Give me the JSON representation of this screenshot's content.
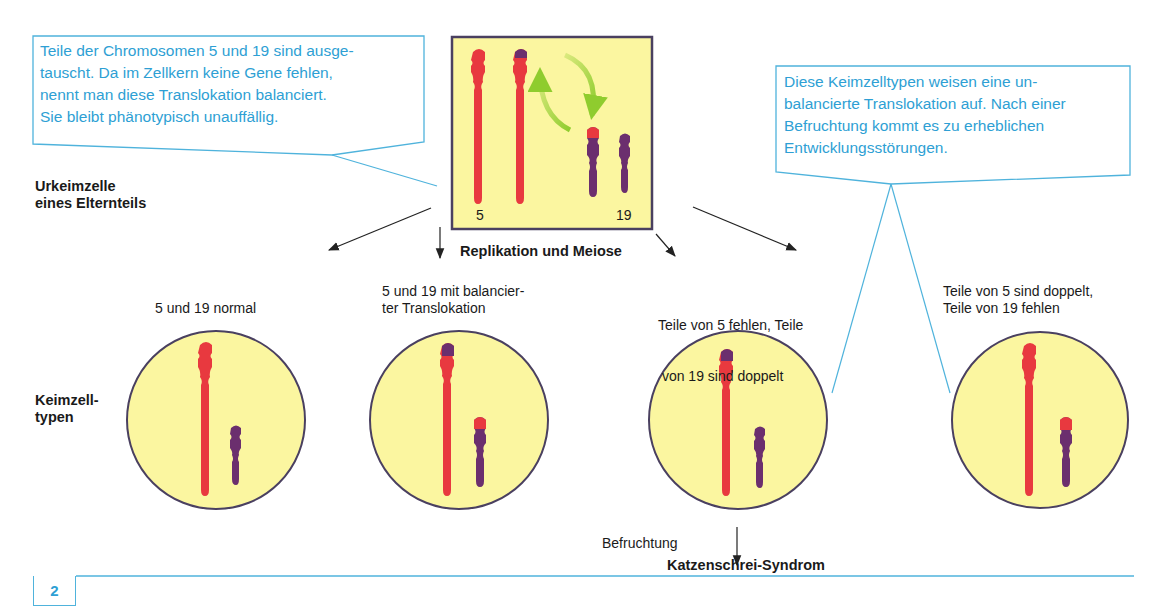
{
  "colors": {
    "callout_blue": "#4fb3dc",
    "callout_text": "#2e9fd4",
    "cell_fill": "#fbf6a0",
    "cell_stroke": "#4a4060",
    "chromosome5": "#e8393f",
    "chromosome19": "#6b2f6e",
    "exchange_arrow": "#8fcc2e",
    "black_arrow": "#222222"
  },
  "callouts": {
    "left": {
      "lines": [
        "Teile der Chromosomen 5 und 19 sind ausge-",
        "tauscht. Da im Zellkern keine Gene fehlen,",
        "nennt man diese Translokation balanciert.",
        "Sie bleibt phänotypisch unauffällig."
      ]
    },
    "right": {
      "lines": [
        "Diese Keimzelltypen weisen eine un-",
        "balancierte Translokation auf. Nach einer",
        "Befruchtung kommt es zu erheblichen",
        "Entwicklungsstörungen."
      ]
    }
  },
  "labels": {
    "parent_cell": [
      "Urkeimzelle",
      "eines Elternteils"
    ],
    "germ_cell_types": [
      "Keimzell-",
      "typen"
    ],
    "process": "Replikation und Meiose",
    "fertilization": "Befruchtung",
    "syndrome": "Katzenschrei-Syndrom",
    "page_number": "2"
  },
  "parent_box": {
    "chromosome_labels": {
      "five": "5",
      "nineteen": "19"
    }
  },
  "germ_cells": [
    {
      "caption": [
        "5 und 19 normal"
      ]
    },
    {
      "caption": [
        "5 und 19 mit balancier-",
        "ter Translokation"
      ]
    },
    {
      "caption": [
        "Teile von 5 fehlen, Teile",
        " von 19 sind doppelt"
      ]
    },
    {
      "caption": [
        "Teile von 5 sind doppelt,",
        "Teile von 19 fehlen"
      ]
    }
  ]
}
